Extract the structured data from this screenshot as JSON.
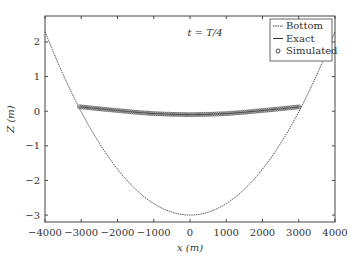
{
  "chart_data": {
    "type": "line",
    "title": "",
    "annotation": "t = T/4",
    "xlabel": "x (m)",
    "ylabel": "Z (m)",
    "xlim": [
      -4000,
      4000
    ],
    "ylim": [
      -3.2,
      2.75
    ],
    "xticks": [
      -4000,
      -3000,
      -2000,
      -1000,
      0,
      1000,
      2000,
      3000,
      4000
    ],
    "yticks": [
      -3,
      -2,
      -1,
      0,
      1,
      2
    ],
    "grid": false,
    "legend_position": "upper right",
    "legend": [
      "Bottom",
      "Exact",
      "Simulated"
    ],
    "series": [
      {
        "name": "Bottom",
        "style": "dotted-line",
        "x": [
          -4000,
          -3500,
          -3000,
          -2500,
          -2000,
          -1500,
          -1000,
          -500,
          0,
          500,
          1000,
          1500,
          2000,
          2500,
          3000,
          3500,
          4000
        ],
        "values": [
          2.3,
          1.06,
          -0.02,
          -0.93,
          -1.68,
          -2.25,
          -2.67,
          -2.92,
          -3.0,
          -2.92,
          -2.67,
          -2.25,
          -1.68,
          -0.93,
          -0.02,
          1.06,
          2.3
        ]
      },
      {
        "name": "Exact",
        "style": "solid-line",
        "x": [
          -3050,
          -2500,
          -2000,
          -1500,
          -1000,
          -500,
          0,
          500,
          1000,
          1500,
          2000,
          2500,
          3050
        ],
        "values": [
          0.13,
          0.07,
          0.02,
          -0.03,
          -0.07,
          -0.09,
          -0.1,
          -0.09,
          -0.07,
          -0.03,
          0.02,
          0.07,
          0.13
        ]
      },
      {
        "name": "Simulated",
        "style": "circle-markers",
        "x": [
          -3050,
          -2500,
          -2000,
          -1500,
          -1000,
          -500,
          0,
          500,
          1000,
          1500,
          2000,
          2500,
          3050
        ],
        "values": [
          0.13,
          0.07,
          0.02,
          -0.03,
          -0.07,
          -0.09,
          -0.1,
          -0.09,
          -0.07,
          -0.03,
          0.02,
          0.07,
          0.13
        ]
      }
    ]
  }
}
